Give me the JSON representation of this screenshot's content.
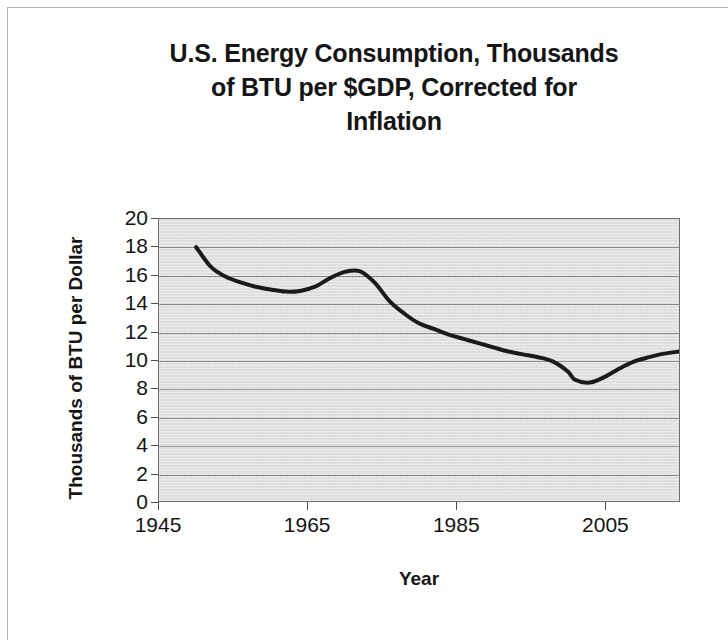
{
  "chart_data": {
    "type": "line",
    "title": "U.S. Energy Consumption, Thousands of BTU per $GDP, Corrected for Inflation",
    "title_lines": [
      "U.S. Energy Consumption, Thousands",
      "of BTU per $GDP, Corrected for",
      "Inflation"
    ],
    "xlabel": "Year",
    "ylabel": "Thousands of BTU per Dollar",
    "xlim": [
      1945,
      2015
    ],
    "ylim": [
      0,
      20
    ],
    "xticks": [
      1945,
      1965,
      1985,
      2005
    ],
    "xtick_labels": [
      "1945",
      "1965",
      "1985",
      "2005"
    ],
    "yticks": [
      0,
      2,
      4,
      6,
      8,
      10,
      12,
      14,
      16,
      18,
      20
    ],
    "ytick_labels": [
      "0",
      "2",
      "4",
      "6",
      "8",
      "10",
      "12",
      "14",
      "16",
      "18",
      "20"
    ],
    "grid": true,
    "grid_axis": "y",
    "legend": null,
    "legend_position": "none",
    "plot_background_color": "#e7e7e7",
    "line_color": "#1a1a1a",
    "line_width": 4,
    "series": [
      {
        "name": "U.S. Energy Consumption per $GDP",
        "x": [
          1950,
          1952,
          1954,
          1956,
          1958,
          1960,
          1962,
          1964,
          1966,
          1968,
          1970,
          1972,
          1974,
          1976,
          1978,
          1980,
          1982,
          1984,
          1986,
          1988,
          1990,
          1992,
          1994,
          1996,
          1998,
          2000,
          2001,
          2003,
          2005,
          2007,
          2009,
          2011,
          2013,
          2015
        ],
        "values": [
          18.0,
          16.6,
          15.9,
          15.5,
          15.2,
          15.0,
          14.85,
          14.9,
          15.2,
          15.8,
          16.25,
          16.3,
          15.5,
          14.2,
          13.3,
          12.6,
          12.2,
          11.8,
          11.5,
          11.2,
          10.9,
          10.6,
          10.4,
          10.2,
          9.9,
          9.2,
          8.6,
          8.4,
          8.8,
          9.4,
          9.9,
          10.2,
          10.45,
          10.6
        ]
      }
    ],
    "annotations": []
  }
}
